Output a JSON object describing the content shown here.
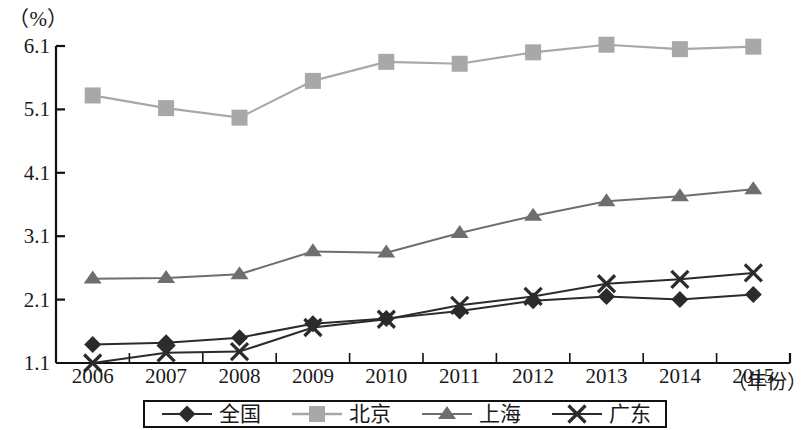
{
  "axis": {
    "unit_label": "（%）",
    "x_axis_name": "（年份）",
    "y_ticks": [
      "1.1",
      "2.1",
      "3.1",
      "4.1",
      "5.1",
      "6.1"
    ],
    "x_ticks": [
      "2006",
      "2007",
      "2008",
      "2009",
      "2010",
      "2011",
      "2012",
      "2013",
      "2014",
      "2015"
    ]
  },
  "legend": {
    "items": [
      {
        "label": "全国",
        "marker": "diamond-marker",
        "color": "#2b2b2b"
      },
      {
        "label": "北京",
        "marker": "square-marker",
        "color": "#a8a8a8"
      },
      {
        "label": "上海",
        "marker": "triangle-marker",
        "color": "#6e6e6e"
      },
      {
        "label": "广东",
        "marker": "cross-marker",
        "color": "#2b2b2b"
      }
    ]
  },
  "chart_data": {
    "type": "line",
    "title": "",
    "xlabel": "（年份）",
    "ylabel": "（%）",
    "ylim": [
      1.1,
      6.1
    ],
    "ytick_values": [
      1.1,
      2.1,
      3.1,
      4.1,
      5.1,
      6.1
    ],
    "grid": false,
    "legend_position": "bottom",
    "categories": [
      "2006",
      "2007",
      "2008",
      "2009",
      "2010",
      "2011",
      "2012",
      "2013",
      "2014",
      "2015"
    ],
    "series": [
      {
        "name": "全国",
        "marker": "diamond",
        "color": "#2b2b2b",
        "values": [
          1.39,
          1.42,
          1.5,
          1.72,
          1.8,
          1.92,
          2.08,
          2.15,
          2.1,
          2.18
        ]
      },
      {
        "name": "北京",
        "marker": "square",
        "color": "#a8a8a8",
        "values": [
          5.32,
          5.12,
          4.97,
          5.55,
          5.85,
          5.82,
          6.0,
          6.12,
          6.05,
          6.09
        ]
      },
      {
        "name": "上海",
        "marker": "triangle",
        "color": "#6e6e6e",
        "values": [
          2.43,
          2.44,
          2.5,
          2.86,
          2.84,
          3.15,
          3.42,
          3.65,
          3.73,
          3.84
        ]
      },
      {
        "name": "广东",
        "marker": "cross",
        "color": "#2b2b2b",
        "values": [
          1.1,
          1.26,
          1.28,
          1.66,
          1.79,
          2.01,
          2.15,
          2.35,
          2.42,
          2.52
        ]
      }
    ]
  }
}
